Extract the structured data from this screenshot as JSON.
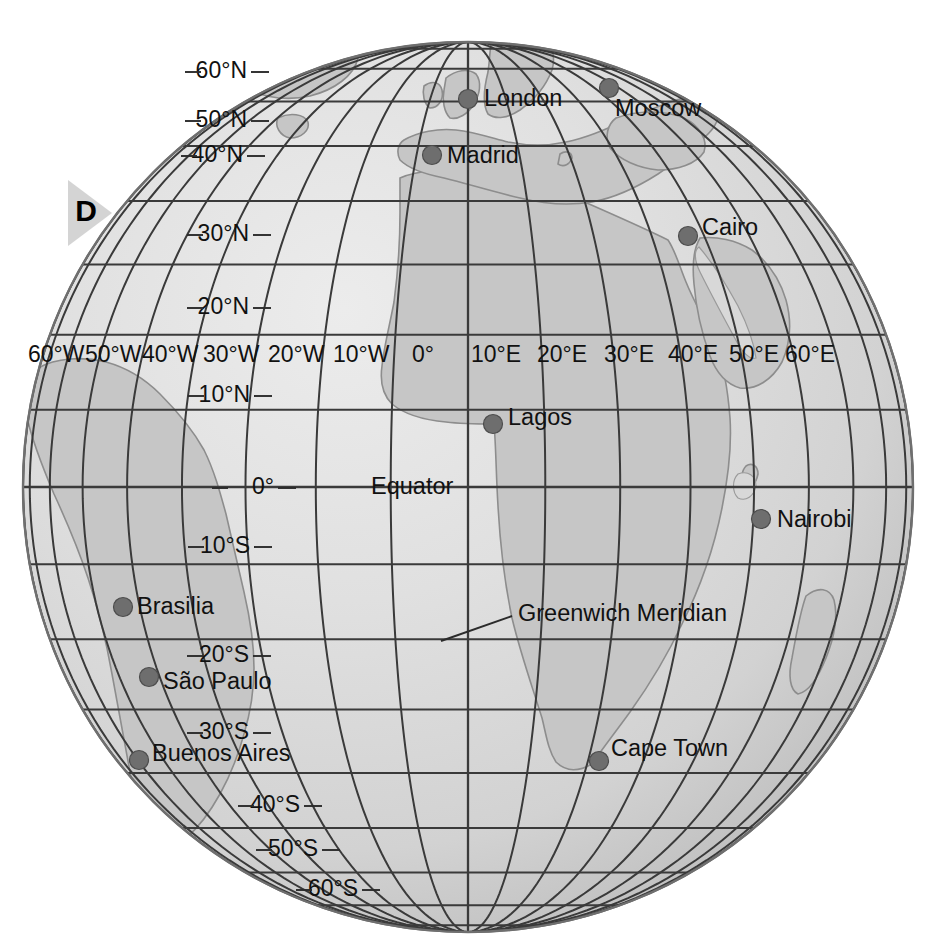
{
  "figure": {
    "label": "D",
    "type": "globe-orthographic-projection",
    "center_lon": 0,
    "center_lat": 0
  },
  "colors": {
    "ocean": "#dcdcdc",
    "land": "#c9c9c9",
    "graticule": "#3a3a3a",
    "outline": "#666666",
    "city_dot": "#6e6e6e",
    "text": "#111111",
    "callout_triangle": "#d4d4d4",
    "background": "#ffffff"
  },
  "annotations": {
    "equator_label": "Equator",
    "meridian_label": "Greenwich Meridian"
  },
  "latitude_labels": [
    {
      "text": "60°N",
      "lat": 60,
      "x": 247,
      "y": 72
    },
    {
      "text": "50°N",
      "lat": 50,
      "x": 247,
      "y": 121
    },
    {
      "text": "40°N",
      "lat": 40,
      "x": 243,
      "y": 156
    },
    {
      "text": "30°N",
      "lat": 30,
      "x": 249,
      "y": 235
    },
    {
      "text": "20°N",
      "lat": 20,
      "x": 249,
      "y": 308
    },
    {
      "text": "10°N",
      "lat": 10,
      "x": 250,
      "y": 396
    },
    {
      "text": "0°",
      "lat": 0,
      "x": 274,
      "y": 488
    },
    {
      "text": "10°S",
      "lat": -10,
      "x": 250,
      "y": 547
    },
    {
      "text": "20°S",
      "lat": -20,
      "x": 249,
      "y": 656
    },
    {
      "text": "30°S",
      "lat": -30,
      "x": 249,
      "y": 733
    },
    {
      "text": "40°S",
      "lat": -40,
      "x": 300,
      "y": 806
    },
    {
      "text": "50°S",
      "lat": -50,
      "x": 318,
      "y": 850
    },
    {
      "text": "60°S",
      "lat": -60,
      "x": 358,
      "y": 890
    }
  ],
  "longitude_labels": [
    {
      "text": "60°W",
      "lon": -60,
      "x": 28
    },
    {
      "text": "50°W",
      "lon": -50,
      "x": 85
    },
    {
      "text": "40°W",
      "lon": -40,
      "x": 142
    },
    {
      "text": "30°W",
      "lon": -30,
      "x": 203
    },
    {
      "text": "20°W",
      "lon": -20,
      "x": 268
    },
    {
      "text": "10°W",
      "lon": -10,
      "x": 333
    },
    {
      "text": "0°",
      "lon": 0,
      "x": 412
    },
    {
      "text": "10°E",
      "lon": 10,
      "x": 471
    },
    {
      "text": "20°E",
      "lon": 20,
      "x": 537
    },
    {
      "text": "30°E",
      "lon": 30,
      "x": 604
    },
    {
      "text": "40°E",
      "lon": 40,
      "x": 668
    },
    {
      "text": "50°E",
      "lon": 50,
      "x": 729
    },
    {
      "text": "60°E",
      "lon": 60,
      "x": 785
    }
  ],
  "longitude_label_row_y": 356,
  "cities": [
    {
      "name": "London",
      "dot_x": 468,
      "dot_y": 99,
      "label_x": 484,
      "label_y": 100
    },
    {
      "name": "Moscow",
      "dot_x": 609,
      "dot_y": 88,
      "label_x": 615,
      "label_y": 110
    },
    {
      "name": "Madrid",
      "dot_x": 432,
      "dot_y": 155,
      "label_x": 447,
      "label_y": 157
    },
    {
      "name": "Cairo",
      "dot_x": 688,
      "dot_y": 236,
      "label_x": 702,
      "label_y": 229
    },
    {
      "name": "Lagos",
      "dot_x": 493,
      "dot_y": 424,
      "label_x": 508,
      "label_y": 419
    },
    {
      "name": "Nairobi",
      "dot_x": 761,
      "dot_y": 519,
      "label_x": 777,
      "label_y": 521
    },
    {
      "name": "Brasilia",
      "dot_x": 123,
      "dot_y": 607,
      "label_x": 137,
      "label_y": 608
    },
    {
      "name": "São Paulo",
      "dot_x": 149,
      "dot_y": 677,
      "label_x": 163,
      "label_y": 683
    },
    {
      "name": "Buenos Aires",
      "dot_x": 139,
      "dot_y": 760,
      "label_x": 152,
      "label_y": 755
    },
    {
      "name": "Cape Town",
      "dot_x": 599,
      "dot_y": 761,
      "label_x": 611,
      "label_y": 750
    }
  ],
  "callout": {
    "letter": "D",
    "letter_x": 86,
    "letter_y": 213,
    "triangle_points": "68,180 112,213 68,246"
  },
  "equator_annotation": {
    "text": "Equator",
    "x": 371,
    "y": 488
  },
  "meridian_annotation": {
    "text": "Greenwich Meridian",
    "x": 518,
    "y": 615,
    "leader": "M 441,641 L 512,616"
  },
  "geometry": {
    "cx": 468,
    "cy": 487,
    "r": 445,
    "lat_range": [
      -90,
      90
    ],
    "lon_range": [
      -90,
      90
    ],
    "graticule_step_deg": 10
  }
}
